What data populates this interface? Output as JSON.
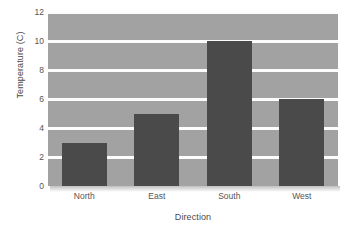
{
  "chart_data": {
    "type": "bar",
    "title": "",
    "xlabel": "Direction",
    "ylabel": "Temperature (C)",
    "categories": [
      "North",
      "East",
      "South",
      "West"
    ],
    "values": [
      3,
      5,
      10,
      6
    ],
    "ylim": [
      0,
      12
    ],
    "yticks": [
      0,
      2,
      4,
      6,
      8,
      10,
      12
    ],
    "ytick_labels": [
      "0",
      "2",
      "4",
      "6",
      "8",
      "10",
      "12"
    ],
    "grid": true,
    "grid_axis": "y",
    "legend": false,
    "legend_position": "none",
    "series": [
      {
        "name": "Temperature",
        "values": [
          3,
          5,
          10,
          6
        ]
      }
    ]
  },
  "style": {
    "plot_background": "#a2a2a2",
    "bar_color": "#4a4a4a",
    "gridline_color": "#fcfcfc",
    "figure_background": "#ffffff",
    "tick_label_color": "#555555",
    "axis_label_color": "#4a4a4a"
  }
}
